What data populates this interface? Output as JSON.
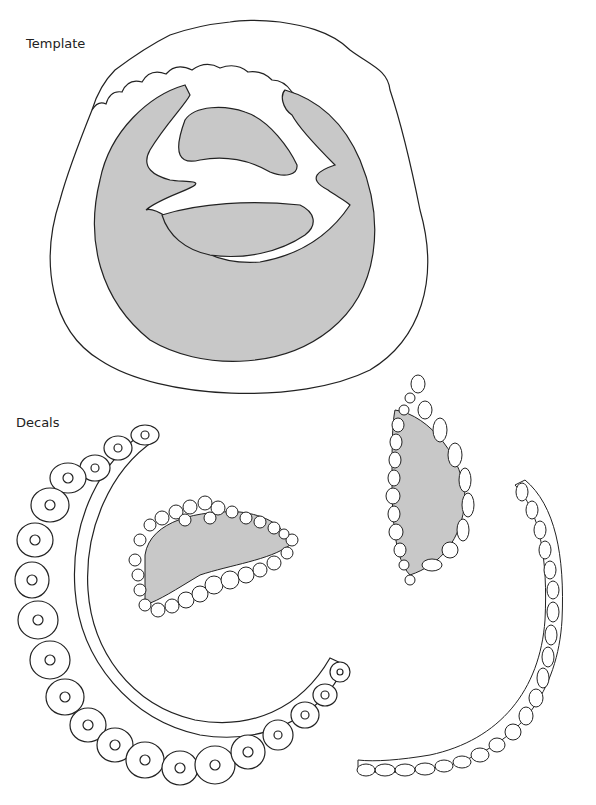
{
  "labels": {
    "template": "Template",
    "decals": "Decals"
  },
  "colors": {
    "stroke": "#222222",
    "fill_gray": "#c8c8c8",
    "background": "#ffffff"
  },
  "sections": [
    {
      "name": "template",
      "description": "Circular outer outline with scalloped top edge, containing gray C-shaped mass with white branching channel and two gray inner lobes"
    },
    {
      "name": "decals",
      "items": [
        "large curved cell layer (left arc, large cells with nuclei)",
        "small gray cavity with cell border (center)",
        "elongated gray oval with cell border (right-center)",
        "thin curved cell strip (right arc)"
      ]
    }
  ]
}
